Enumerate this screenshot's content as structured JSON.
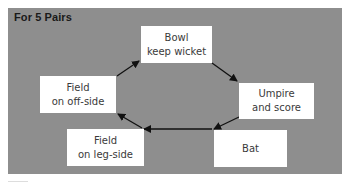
{
  "diagram": {
    "title": "For 5 Pairs",
    "type": "cycle",
    "colors": {
      "panel_background": "#8e8e8e",
      "box_background": "#ffffff",
      "box_text": "#3a3a3a",
      "arrow": "#111111"
    },
    "nodes": [
      {
        "id": "bowl",
        "line1": "Bowl",
        "line2": "keep wicket"
      },
      {
        "id": "umpire",
        "line1": "Umpire",
        "line2": "and score"
      },
      {
        "id": "bat",
        "line1": "Bat",
        "line2": ""
      },
      {
        "id": "leg_side",
        "line1": "Field",
        "line2": "on leg-side"
      },
      {
        "id": "off_side",
        "line1": "Field",
        "line2": "on off-side"
      }
    ],
    "edges": [
      {
        "from": "off_side",
        "to": "bowl"
      },
      {
        "from": "bowl",
        "to": "umpire"
      },
      {
        "from": "umpire",
        "to": "bat"
      },
      {
        "from": "bat",
        "to": "leg_side"
      },
      {
        "from": "leg_side",
        "to": "off_side"
      }
    ]
  }
}
